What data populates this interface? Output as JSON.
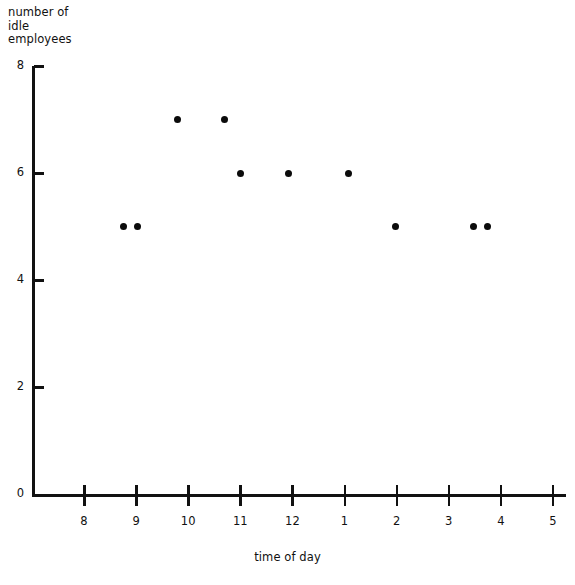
{
  "chart_data": {
    "type": "scatter",
    "title": "",
    "subtitle": "",
    "ylabel": "number of\nidle\nemployees",
    "xlabel": "time of day",
    "grid": false,
    "legend": "none",
    "ylim": [
      0,
      8
    ],
    "y_ticks": [
      0,
      2,
      4,
      6,
      8
    ],
    "y_tick_labels": [
      "0",
      "2",
      "4",
      "6",
      "8"
    ],
    "x_tick_labels": [
      "8",
      "9",
      "10",
      "11",
      "12",
      "1",
      "2",
      "3",
      "4",
      "5"
    ],
    "x_tick_values": [
      8,
      9,
      10,
      11,
      12,
      13,
      14,
      15,
      16,
      17
    ],
    "xlim": [
      7.4,
      17.0
    ],
    "points": [
      {
        "x": 8.75,
        "y": 5,
        "label": "8:45 — 5"
      },
      {
        "x": 9.02,
        "y": 5,
        "label": "9:00 — 5"
      },
      {
        "x": 9.79,
        "y": 7,
        "label": "9:45 — 7"
      },
      {
        "x": 10.69,
        "y": 7,
        "label": "10:40 — 7"
      },
      {
        "x": 11.0,
        "y": 6,
        "label": "11:00 — 6"
      },
      {
        "x": 11.92,
        "y": 6,
        "label": "12:00 — 6"
      },
      {
        "x": 13.08,
        "y": 6,
        "label": "1:05 — 6"
      },
      {
        "x": 13.98,
        "y": 5,
        "label": "2:00 — 5"
      },
      {
        "x": 15.48,
        "y": 5,
        "label": "3:30 — 5"
      },
      {
        "x": 15.75,
        "y": 5,
        "label": "3:45 — 5"
      }
    ],
    "colors": {
      "marker": "#0b0b0b",
      "axis": "#111111",
      "background": "#ffffff"
    }
  },
  "geometry": {
    "x_origin_px": 32,
    "y_zero_px": 494,
    "y_eight_px": 66,
    "x_tick_start_px": 84,
    "x_tick_step_px": 52.1,
    "x_axis_right_px": 566
  }
}
